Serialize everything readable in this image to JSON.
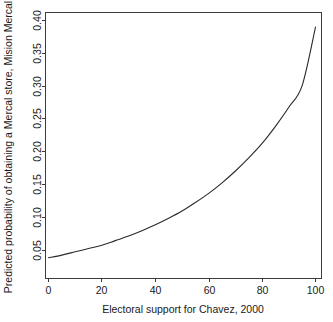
{
  "chart_data": {
    "type": "line",
    "title": "",
    "xlabel": "Electoral support for Chavez, 2000",
    "ylabel": "Predicted probability of obtaining a Mercal store, Mision Mercal",
    "xlim": [
      0,
      100
    ],
    "ylim": [
      0.035,
      0.405
    ],
    "xticks": [
      0,
      20,
      40,
      60,
      80,
      100
    ],
    "xtick_labels": [
      "0",
      "20",
      "40",
      "60",
      "80",
      "100"
    ],
    "yticks": [
      0.05,
      0.1,
      0.15,
      0.2,
      0.25,
      0.3,
      0.35,
      0.4
    ],
    "ytick_labels": [
      "0.05",
      "0.10",
      "0.15",
      "0.20",
      "0.25",
      "0.30",
      "0.35",
      "0.40"
    ],
    "grid": false,
    "legend": false,
    "legend_position": "none",
    "box": true,
    "line_color": "#2a2a2a",
    "background_color": "#ffffff",
    "series": [
      {
        "name": "Predicted probability",
        "x": [
          0,
          5,
          10,
          15,
          20,
          25,
          30,
          35,
          40,
          45,
          50,
          55,
          60,
          65,
          70,
          75,
          80,
          85,
          90,
          95,
          100
        ],
        "values": [
          0.039,
          0.043,
          0.048,
          0.053,
          0.058,
          0.065,
          0.072,
          0.08,
          0.089,
          0.099,
          0.11,
          0.123,
          0.137,
          0.153,
          0.171,
          0.191,
          0.213,
          0.239,
          0.268,
          0.301,
          0.39
        ]
      }
    ]
  },
  "axis": {
    "x_title": "Electoral support for Chavez, 2000",
    "y_title": "Predicted probability of obtaining a Mercal store, Mision Mercal"
  }
}
